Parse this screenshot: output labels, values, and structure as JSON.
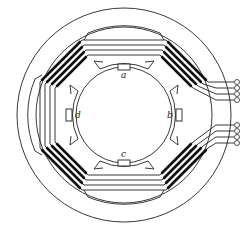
{
  "diagram": {
    "labels": {
      "a": "a",
      "b": "b",
      "c": "c",
      "d": "d"
    },
    "terminals": {
      "upper_group_count": 4,
      "lower_group_count": 4
    },
    "colors": {
      "line": "#222222",
      "conductor": "#111111",
      "background": "#ffffff"
    }
  }
}
